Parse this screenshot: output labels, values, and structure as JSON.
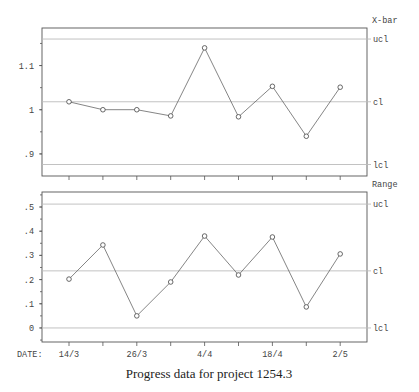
{
  "caption": "Progress data for project 1254.3",
  "x_axis_label": "DATE:",
  "chart_data": [
    {
      "type": "line",
      "title": "X-bar",
      "x": [
        "14/3",
        "",
        "26/3",
        "",
        "4/4",
        "",
        "18/4",
        "",
        "2/5"
      ],
      "tick_labels": [
        "14/3",
        "26/3",
        "4/4",
        "18/4",
        "2/5"
      ],
      "values": [
        1.018,
        1.0,
        1.0,
        0.986,
        1.14,
        0.984,
        1.053,
        0.94,
        1.051
      ],
      "ylim": [
        0.85,
        1.185
      ],
      "yticks": [
        0.9,
        1.0,
        1.1
      ],
      "ytick_labels": [
        ".9",
        "1",
        "1.1"
      ],
      "control_limits": {
        "ucl": 1.16,
        "cl": 1.018,
        "lcl": 0.876
      },
      "limit_labels": {
        "ucl": "ucl",
        "cl": "cl",
        "lcl": "lcl"
      },
      "grid": false
    },
    {
      "type": "line",
      "title": "Range",
      "x": [
        "14/3",
        "",
        "26/3",
        "",
        "4/4",
        "",
        "18/4",
        "",
        "2/5"
      ],
      "tick_labels": [
        "14/3",
        "26/3",
        "4/4",
        "18/4",
        "2/5"
      ],
      "values": [
        0.202,
        0.343,
        0.05,
        0.19,
        0.38,
        0.219,
        0.376,
        0.087,
        0.306
      ],
      "ylim": [
        -0.058,
        0.562
      ],
      "yticks": [
        0,
        0.1,
        0.2,
        0.3,
        0.4,
        0.5
      ],
      "ytick_labels": [
        "0",
        ".1",
        ".2",
        ".3",
        ".4",
        ".5"
      ],
      "control_limits": {
        "ucl": 0.512,
        "cl": 0.236,
        "lcl": 0.0
      },
      "limit_labels": {
        "ucl": "ucl",
        "cl": "cl",
        "lcl": "lcl"
      },
      "grid": false
    }
  ]
}
